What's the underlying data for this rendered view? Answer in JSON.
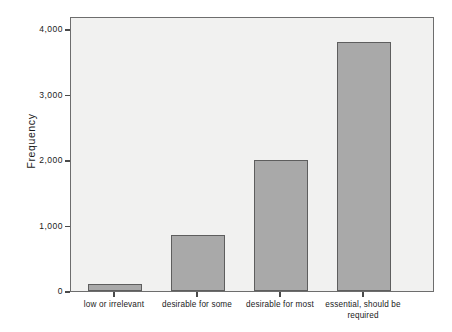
{
  "chart_data": {
    "type": "bar",
    "title": "",
    "subtitle": "",
    "xlabel": "",
    "ylabel": "Frequency",
    "categories": [
      "low or irrelevant",
      "desirable for some",
      "desirable for most",
      "essential, should be required"
    ],
    "category_lines": [
      [
        "low or irrelevant"
      ],
      [
        "desirable for some"
      ],
      [
        "desirable for most"
      ],
      [
        "essential, should be",
        "required"
      ]
    ],
    "values": [
      100,
      850,
      2000,
      3800
    ],
    "ylim": [
      0,
      4200
    ],
    "yticks": [
      0,
      1000,
      2000,
      3000,
      4000
    ],
    "ytick_labels": [
      "0",
      "1,000",
      "2,000",
      "3,000",
      "4,000"
    ],
    "grid": false,
    "legend": null,
    "bar_color": "#a9a9a9",
    "bar_edge_color": "#5e5e5e",
    "plot_background": "#f1f1f0",
    "frame_color": "#6d6d6d",
    "axis_text_color": "#1a1a1a"
  }
}
